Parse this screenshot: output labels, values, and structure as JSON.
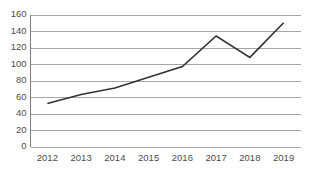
{
  "chart_data": {
    "type": "line",
    "title": "",
    "subtitle": "",
    "xlabel": "",
    "ylabel": "",
    "categories": [
      "2012",
      "2013",
      "2014",
      "2015",
      "2016",
      "2017",
      "2018",
      "2019"
    ],
    "values": [
      52,
      63,
      71,
      84,
      97,
      134,
      108,
      150
    ],
    "series": [
      {
        "name": "",
        "values": [
          52,
          63,
          71,
          84,
          97,
          134,
          108,
          150
        ]
      }
    ],
    "ylim": [
      0,
      160
    ],
    "ytick_labels": [
      "0",
      "20",
      "40",
      "60",
      "80",
      "100",
      "120",
      "140",
      "160"
    ],
    "ytick_values": [
      0,
      20,
      40,
      60,
      80,
      100,
      120,
      140,
      160
    ],
    "xtick_labels": [
      "2012",
      "2013",
      "2014",
      "2015",
      "2016",
      "2017",
      "2018",
      "2019"
    ],
    "grid": "horizontal",
    "legend": "none",
    "markers": "none",
    "colors": {
      "line": "#333333",
      "gridline": "#a6a6a6",
      "axis": "#808080",
      "tick_label": "#4d4d4d",
      "background": "#ffffff"
    }
  }
}
